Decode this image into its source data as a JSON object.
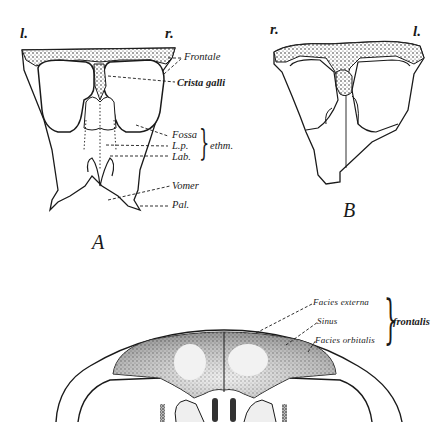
{
  "figure_A": {
    "letter": "A",
    "side_left": "l.",
    "side_right": "r.",
    "labels": {
      "frontale": "Frontale",
      "crista_galli": "Crista galli",
      "fossa": "Fossa",
      "lp": "L.p.",
      "lab": "Lab.",
      "ethm": "ethm.",
      "vomer": "Vomer",
      "pal": "Pal."
    }
  },
  "figure_B": {
    "letter": "B",
    "side_left": "r.",
    "side_right": "l."
  },
  "figure_C": {
    "labels": {
      "facies_externa": "Facies externa",
      "sinus": "Sinus",
      "facies_orbitalis": "Facies orbitalis",
      "frontalis": "frontalis"
    }
  },
  "colors": {
    "ink": "#1a1a1a",
    "paper": "#ffffff",
    "stipple": "#555555"
  }
}
